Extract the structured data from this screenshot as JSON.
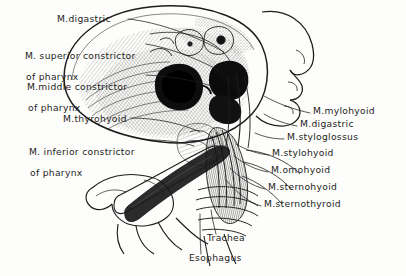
{
  "figure": {
    "type": "anatomical-illustration",
    "style": "pen-and-ink engraving, hand-lettered labels",
    "background_color": "#fdfdfb",
    "ink_color": "#1d1d1d"
  },
  "labels_left": [
    {
      "id": "m-digastric-left",
      "text": "M.digastric",
      "x": 57,
      "y": 14
    },
    {
      "id": "m-superior-constrictor",
      "line1": "M. superior constrictor",
      "line2": "of pharynx",
      "x": 12,
      "y": 40
    },
    {
      "id": "m-middle-constrictor",
      "line1": "M.middle constrictor",
      "line2": "of pharynx",
      "x": 14,
      "y": 71
    },
    {
      "id": "m-thyrohyoid",
      "text": "M.thyrohyoid",
      "x": 63,
      "y": 114
    },
    {
      "id": "m-inferior-constrictor",
      "line1": "M. inferior constrictor",
      "line2": "of pharynx",
      "x": 16,
      "y": 136
    }
  ],
  "labels_right": [
    {
      "id": "m-mylohyoid",
      "text": "M.mylohyoid",
      "x": 313,
      "y": 111
    },
    {
      "id": "m-digastric-right",
      "text": "M.digastric",
      "x": 300,
      "y": 124
    },
    {
      "id": "m-styloglossus",
      "text": "M.styloglossus",
      "x": 287,
      "y": 137
    },
    {
      "id": "m-stylohyoid",
      "text": "M.stylohyoid",
      "x": 272,
      "y": 153
    },
    {
      "id": "m-omohyoid",
      "text": "M.omohyoid",
      "x": 271,
      "y": 170
    },
    {
      "id": "m-sternohyoid",
      "text": "M.sternohyoid",
      "x": 268,
      "y": 187
    },
    {
      "id": "m-sternothyroid",
      "text": "M.sternothyroid",
      "x": 264,
      "y": 204
    }
  ],
  "labels_bottom": [
    {
      "id": "trachea",
      "text": "Trachea",
      "x": 207,
      "y": 238
    },
    {
      "id": "esophagus",
      "text": "Esophagus",
      "x": 189,
      "y": 258
    }
  ]
}
